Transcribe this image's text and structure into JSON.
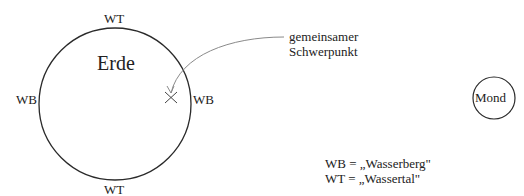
{
  "diagram": {
    "earth": {
      "label": "Erde"
    },
    "moon": {
      "label": "Mond"
    },
    "bulges": {
      "top": "WT",
      "bottom": "WT",
      "left": "WB",
      "right": "WB"
    },
    "barycenter": {
      "label_line1": "gemeinsamer",
      "label_line2": "Schwerpunkt",
      "marker": "x-cross"
    },
    "legend": {
      "line1": "WB = „Wasserberg\"",
      "line2": "WT = „Wassertal\""
    },
    "colors": {
      "outline": "#2a2a2a",
      "arrow": "#8a8a8a",
      "text": "#222222"
    }
  }
}
